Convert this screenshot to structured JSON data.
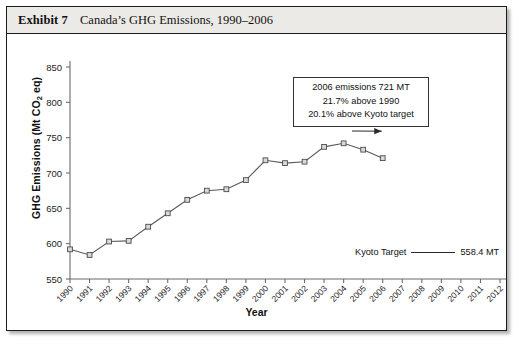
{
  "exhibit": {
    "label": "Exhibit 7",
    "title": "Canada’s GHG Emissions, 1990–2006"
  },
  "annotation": {
    "line1": "2006 emissions 721 MT",
    "line2": "21.7% above 1990",
    "line3": "20.1% above Kyoto target"
  },
  "legend": {
    "label": "Kyoto Target",
    "value": "558.4 MT"
  },
  "colors": {
    "line": "#5b5b5b",
    "marker_fill": "#d9d9d9",
    "marker_stroke": "#4a4a4a",
    "axis": "#6b6b6b",
    "header_bg": "#eceae6",
    "text": "#111111"
  },
  "chart_data": {
    "type": "line",
    "title": "Canada’s GHG Emissions, 1990–2006",
    "xlabel": "Year",
    "ylabel": "GHG Emissions (Mt CO2 eq)",
    "ylim": [
      550,
      850
    ],
    "ytick_labels": [
      "850",
      "800",
      "750",
      "700",
      "650",
      "600",
      "550"
    ],
    "yticks": [
      850,
      800,
      750,
      700,
      650,
      600,
      550
    ],
    "xlim": [
      1990,
      2012
    ],
    "xticks": [
      1990,
      1991,
      1992,
      1993,
      1994,
      1995,
      1996,
      1997,
      1998,
      1999,
      2000,
      2001,
      2002,
      2003,
      2004,
      2005,
      2006,
      2007,
      2008,
      2009,
      2010,
      2011,
      2012
    ],
    "xtick_labels": [
      "1990",
      "1991",
      "1992",
      "1993",
      "1994",
      "1995",
      "1996",
      "1997",
      "1998",
      "1999",
      "2000",
      "2001",
      "2002",
      "2003",
      "2004",
      "2005",
      "2006",
      "2007",
      "2008",
      "2009",
      "2010",
      "2011",
      "2012"
    ],
    "grid": false,
    "legend_position": "inside-lower-right",
    "series": [
      {
        "name": "GHG Emissions",
        "marker": "square",
        "x": [
          1990,
          1991,
          1992,
          1993,
          1994,
          1995,
          1996,
          1997,
          1998,
          1999,
          2000,
          2001,
          2002,
          2003,
          2004,
          2005,
          2006
        ],
        "values": [
          592,
          584,
          603,
          604,
          624,
          643,
          662,
          675,
          677,
          690,
          718,
          714,
          716,
          737,
          742,
          733,
          721
        ]
      }
    ],
    "reference_line": {
      "name": "Kyoto Target",
      "value": 558.4,
      "unit": "MT"
    },
    "annotations": [
      "2006 emissions 721 MT",
      "21.7% above 1990",
      "20.1% above Kyoto target"
    ]
  }
}
